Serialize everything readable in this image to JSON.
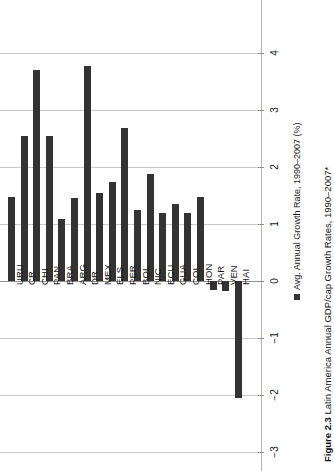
{
  "figure": {
    "number_label": "Figure 2.3",
    "caption_text": "Latin America Annual GDP/cap Growth Rates, 1990–2007*"
  },
  "legend": {
    "series_label": "Avg. Annual Growth Rate, 1990–2007 (%)",
    "swatch_color": "#333333"
  },
  "axis": {
    "tick_labels": [
      "4",
      "3",
      "2",
      "1",
      "0",
      "−1",
      "−2",
      "−3"
    ]
  },
  "colors": {
    "bar": "#333333",
    "gridline": "#c9c9c9",
    "zeroline": "#8f8f8f",
    "text": "#1a1a1a",
    "background": "#ffffff"
  },
  "chart_data": {
    "type": "bar",
    "title": "Latin America Annual GDP/cap Growth Rates, 1990–2007*",
    "xlabel": "",
    "ylabel": "Avg. Annual Growth Rate, 1990–2007 (%)",
    "ylim": [
      -3,
      4
    ],
    "yticks": [
      -3,
      -2,
      -1,
      0,
      1,
      2,
      3,
      4
    ],
    "grid": true,
    "orientation": "vertical-rotated-90",
    "legend_position": "right",
    "categories": [
      "URU",
      "CR",
      "CHI",
      "PAN",
      "BRA",
      "ARG",
      "DR",
      "MEX",
      "ELS",
      "PER",
      "BOL",
      "NIC",
      "ECU",
      "GUA",
      "COL",
      "HON",
      "PAR",
      "VEN",
      "HAI"
    ],
    "series": [
      {
        "name": "Avg. Annual Growth Rate, 1990–2007 (%)",
        "values": [
          1.47,
          2.54,
          3.7,
          2.54,
          1.09,
          1.45,
          3.77,
          1.55,
          1.74,
          2.68,
          1.25,
          1.88,
          1.19,
          1.35,
          1.19,
          1.47,
          -0.15,
          -0.18,
          -2.05
        ]
      }
    ]
  }
}
